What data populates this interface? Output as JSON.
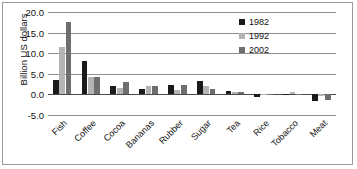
{
  "chart_data": {
    "type": "bar",
    "title": "",
    "xlabel": "",
    "ylabel": "Billion US dollars",
    "ylim": [
      -5.0,
      20.0
    ],
    "ytick_labels": [
      "20.0",
      "15.0",
      "10.0",
      "5.0",
      "0.0",
      "-5.0"
    ],
    "ytick_values": [
      20.0,
      15.0,
      10.0,
      5.0,
      0.0,
      -5.0
    ],
    "grid": true,
    "legend_position": "top-right",
    "categories": [
      "Fish",
      "Coffee",
      "Cocoa",
      "Bananas",
      "Rubber",
      "Sugar",
      "Tea",
      "Rice",
      "Tobacco",
      "Meat"
    ],
    "series": [
      {
        "name": "1982",
        "color": "#1a1a1a",
        "values": [
          3.5,
          8.0,
          2.0,
          1.2,
          2.3,
          3.2,
          0.9,
          -0.6,
          0.1,
          -1.5
        ]
      },
      {
        "name": "1992",
        "color": "#b4b4b4",
        "values": [
          11.5,
          4.3,
          1.5,
          2.0,
          1.0,
          2.0,
          0.6,
          -0.2,
          0.5,
          -0.3
        ]
      },
      {
        "name": "2002",
        "color": "#6e6e6e",
        "values": [
          17.5,
          4.2,
          3.0,
          2.0,
          2.3,
          1.3,
          0.6,
          -0.1,
          0.1,
          -1.3
        ]
      }
    ]
  },
  "legend": {
    "entries": [
      {
        "label": "1982"
      },
      {
        "label": "1992"
      },
      {
        "label": "2002"
      }
    ]
  }
}
